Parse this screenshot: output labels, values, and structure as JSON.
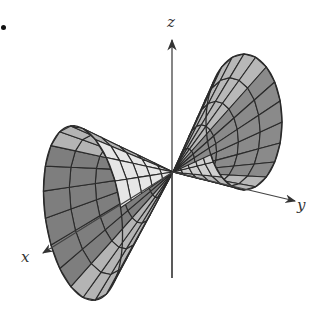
{
  "figure": {
    "bullet": true,
    "axes": {
      "origin": [
        173,
        172
      ],
      "z": {
        "label": "z",
        "from": [
          172,
          278
        ],
        "to": [
          172,
          40
        ],
        "label_pos": [
          167,
          27
        ]
      },
      "x": {
        "label": "x",
        "from": [
          173,
          172
        ],
        "to": [
          43,
          253
        ],
        "label_pos": [
          21,
          262
        ]
      },
      "y": {
        "label": "y",
        "from": [
          173,
          172
        ],
        "to": [
          295,
          201
        ],
        "label_pos": [
          297,
          210
        ]
      }
    },
    "cones": [
      {
        "name": "right-nappe",
        "rim_center": [
          244,
          122
        ],
        "rim_rx": 38,
        "rim_ry": 68,
        "rim_rotation_deg": 0,
        "rings": 5,
        "spokes": 20,
        "fill_front": "#b8b8b8",
        "fill_light": "#cfcfcf",
        "fill_dark": "#8a8a8a"
      },
      {
        "name": "left-nappe",
        "rim_center": [
          83,
          213
        ],
        "rim_rx": 38,
        "rim_ry": 88,
        "rim_rotation_deg": -8,
        "rings": 5,
        "spokes": 20,
        "fill_front": "#b4b4b4",
        "fill_light": "#e6e6e6",
        "fill_dark": "#7e7e7e"
      }
    ],
    "colors": {
      "mesh_line": "#2a2a2a",
      "axis": "#444444",
      "label": "#333333"
    }
  }
}
